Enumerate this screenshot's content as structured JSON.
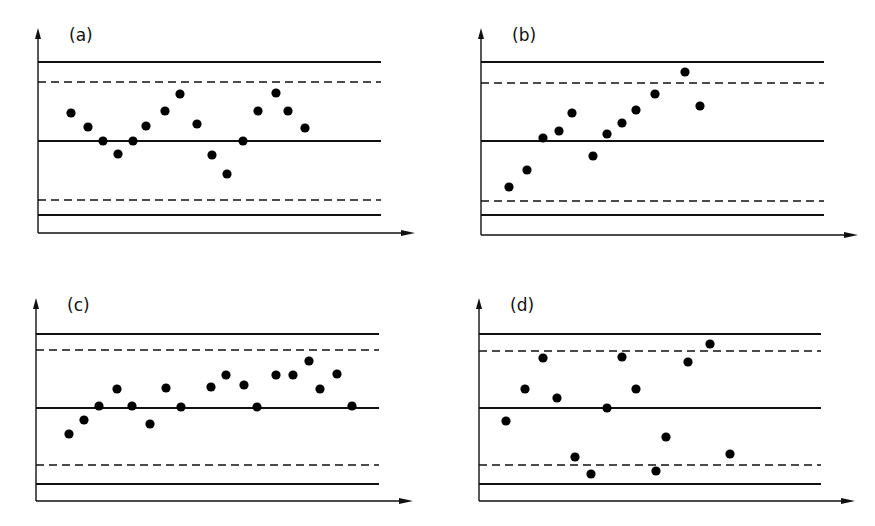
{
  "figure": {
    "line_color": "#111111",
    "point_color": "#000000"
  },
  "chart_data": [
    {
      "type": "scatter",
      "label": "(a)",
      "title": "(a)",
      "xlabel": "",
      "ylabel": "",
      "axes": {
        "origin": [
          38,
          233
        ],
        "y_top": 28,
        "x_right": 415
      },
      "limits": {
        "ucl": 62,
        "uwl": 82,
        "cl": 141,
        "lwl": 200,
        "lcl": 215,
        "x_start": 38,
        "x_end": 381
      },
      "points": [
        [
          71,
          113
        ],
        [
          88,
          127
        ],
        [
          103,
          141
        ],
        [
          118,
          154
        ],
        [
          133,
          141
        ],
        [
          146,
          126
        ],
        [
          165,
          111
        ],
        [
          180,
          94
        ],
        [
          197,
          124
        ],
        [
          212,
          155
        ],
        [
          227,
          174
        ],
        [
          243,
          141
        ],
        [
          258,
          111
        ],
        [
          276,
          93
        ],
        [
          288,
          111
        ],
        [
          305,
          128
        ]
      ]
    },
    {
      "type": "scatter",
      "label": "(b)",
      "title": "(b)",
      "xlabel": "",
      "ylabel": "",
      "axes": {
        "origin": [
          481,
          235
        ],
        "y_top": 28,
        "x_right": 858
      },
      "limits": {
        "ucl": 62,
        "uwl": 83,
        "cl": 141,
        "lwl": 201,
        "lcl": 215,
        "x_start": 481,
        "x_end": 824
      },
      "points": [
        [
          509,
          187
        ],
        [
          527,
          170
        ],
        [
          543,
          138
        ],
        [
          559,
          131
        ],
        [
          572,
          113
        ],
        [
          593,
          156
        ],
        [
          607,
          134
        ],
        [
          622,
          123
        ],
        [
          636,
          110
        ],
        [
          655,
          94
        ],
        [
          685,
          72
        ],
        [
          700,
          106
        ]
      ]
    },
    {
      "type": "scatter",
      "label": "(c)",
      "title": "(c)",
      "xlabel": "",
      "ylabel": "",
      "axes": {
        "origin": [
          36,
          501
        ],
        "y_top": 298,
        "x_right": 413
      },
      "limits": {
        "ucl": 334,
        "uwl": 350,
        "cl": 408,
        "lwl": 465,
        "lcl": 484,
        "x_start": 36,
        "x_end": 379
      },
      "points": [
        [
          69,
          434
        ],
        [
          84,
          420
        ],
        [
          99,
          406
        ],
        [
          117,
          389
        ],
        [
          132,
          406
        ],
        [
          150,
          424
        ],
        [
          166,
          388
        ],
        [
          181,
          407
        ],
        [
          211,
          387
        ],
        [
          226,
          375
        ],
        [
          244,
          385
        ],
        [
          257,
          407
        ],
        [
          276,
          375
        ],
        [
          293,
          375
        ],
        [
          309,
          361
        ],
        [
          320,
          389
        ],
        [
          337,
          374
        ],
        [
          352,
          406
        ]
      ]
    },
    {
      "type": "scatter",
      "label": "(d)",
      "title": "(d)",
      "xlabel": "",
      "ylabel": "",
      "axes": {
        "origin": [
          479,
          501
        ],
        "y_top": 298,
        "x_right": 855
      },
      "limits": {
        "ucl": 334,
        "uwl": 351,
        "cl": 408,
        "lwl": 465,
        "lcl": 484,
        "x_start": 479,
        "x_end": 821
      },
      "points": [
        [
          506,
          421
        ],
        [
          525,
          389
        ],
        [
          543,
          358
        ],
        [
          557,
          398
        ],
        [
          575,
          457
        ],
        [
          591,
          474
        ],
        [
          607,
          408
        ],
        [
          622,
          357
        ],
        [
          636,
          389
        ],
        [
          656,
          471
        ],
        [
          666,
          437
        ],
        [
          688,
          362
        ],
        [
          710,
          344
        ],
        [
          730,
          454
        ]
      ]
    }
  ]
}
